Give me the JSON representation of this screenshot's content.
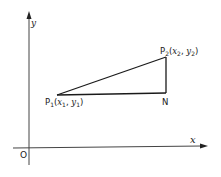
{
  "diagram": {
    "type": "coordinate-geometry",
    "axes": {
      "x_label": "x",
      "y_label": "y",
      "origin_label": "O"
    },
    "points": {
      "p1": {
        "name": "P",
        "subscript": "1",
        "coords": [
          "x",
          "1",
          "y",
          "1"
        ],
        "label_text": "P1(x1, y1)"
      },
      "p2": {
        "name": "P",
        "subscript": "2",
        "coords": [
          "x",
          "2",
          "y",
          "2"
        ],
        "label_text": "P2(x2, y2)"
      },
      "n": {
        "name": "N"
      }
    },
    "segments": [
      "P1-P2",
      "P1-N",
      "N-P2"
    ],
    "colors": {
      "ink": "#1a1a1a",
      "axis": "#444444",
      "background": "#ffffff"
    }
  }
}
